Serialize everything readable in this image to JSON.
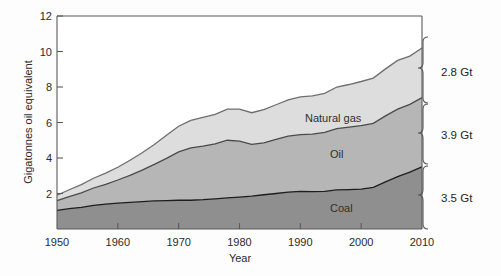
{
  "figure": {
    "background_color": "#fdfdfd",
    "plot_background_color": "#ffffff"
  },
  "axes": {
    "y_title": "Gigatonnes oil equivalent",
    "x_title": "Year",
    "y_ticks": [
      "12",
      "10",
      "8",
      "6",
      "4",
      "2"
    ],
    "x_ticks": [
      "1950",
      "1960",
      "1970",
      "1980",
      "1990",
      "2000",
      "2010"
    ]
  },
  "series_labels": {
    "gas": "Natural gas",
    "oil": "Oil",
    "coal": "Coal"
  },
  "annotations": {
    "gas_total": "2.8 Gt",
    "oil_total": "3.9 Gt",
    "coal_total": "3.5 Gt"
  },
  "colors": {
    "coal": "#8f8f8f",
    "oil": "#b6b6b6",
    "gas": "#dddddd",
    "coal_outline": "#1d1d1d",
    "oil_outline": "#4a4a4a",
    "gas_outline": "#6e6e6e",
    "axis": "#5a5a5a",
    "text": "#2b2b2b"
  },
  "chart_data": {
    "type": "area",
    "title": "",
    "xlabel": "Year",
    "ylabel": "Gigatonnes oil equivalent",
    "xlim": [
      1950,
      2010
    ],
    "ylim": [
      0,
      12
    ],
    "stacked": true,
    "grid": false,
    "legend": "inline-labels",
    "x": [
      1950,
      1952,
      1954,
      1956,
      1958,
      1960,
      1962,
      1964,
      1966,
      1968,
      1970,
      1972,
      1974,
      1976,
      1978,
      1980,
      1982,
      1984,
      1986,
      1988,
      1990,
      1992,
      1994,
      1996,
      1998,
      2000,
      2002,
      2004,
      2006,
      2008,
      2010
    ],
    "series": [
      {
        "name": "Coal",
        "total_2010": 3.5,
        "values": [
          1.05,
          1.15,
          1.22,
          1.33,
          1.4,
          1.46,
          1.5,
          1.54,
          1.58,
          1.6,
          1.62,
          1.62,
          1.65,
          1.7,
          1.75,
          1.8,
          1.85,
          1.93,
          2.0,
          2.08,
          2.12,
          2.1,
          2.12,
          2.2,
          2.22,
          2.25,
          2.35,
          2.65,
          2.95,
          3.2,
          3.5
        ]
      },
      {
        "name": "Oil",
        "total_2010": 3.9,
        "values": [
          0.55,
          0.68,
          0.82,
          0.98,
          1.12,
          1.3,
          1.52,
          1.78,
          2.06,
          2.38,
          2.72,
          2.95,
          3.02,
          3.1,
          3.25,
          3.15,
          2.92,
          2.92,
          3.05,
          3.15,
          3.2,
          3.25,
          3.32,
          3.45,
          3.52,
          3.58,
          3.6,
          3.72,
          3.8,
          3.82,
          3.9
        ]
      },
      {
        "name": "Natural gas",
        "total_2010": 2.8,
        "values": [
          0.3,
          0.38,
          0.46,
          0.55,
          0.63,
          0.72,
          0.85,
          0.98,
          1.12,
          1.3,
          1.45,
          1.55,
          1.62,
          1.66,
          1.75,
          1.8,
          1.78,
          1.88,
          1.95,
          2.05,
          2.12,
          2.15,
          2.2,
          2.35,
          2.4,
          2.48,
          2.55,
          2.65,
          2.75,
          2.72,
          2.8
        ]
      }
    ],
    "stack_tops": {
      "coal": [
        1.05,
        1.15,
        1.22,
        1.33,
        1.4,
        1.46,
        1.5,
        1.54,
        1.58,
        1.6,
        1.62,
        1.62,
        1.65,
        1.7,
        1.75,
        1.8,
        1.85,
        1.93,
        2.0,
        2.08,
        2.12,
        2.1,
        2.12,
        2.2,
        2.22,
        2.25,
        2.35,
        2.65,
        2.95,
        3.2,
        3.5
      ],
      "oil": [
        1.6,
        1.83,
        2.04,
        2.31,
        2.52,
        2.76,
        3.02,
        3.32,
        3.64,
        3.98,
        4.34,
        4.57,
        4.67,
        4.8,
        5.0,
        4.95,
        4.77,
        4.85,
        5.05,
        5.23,
        5.32,
        5.35,
        5.44,
        5.65,
        5.74,
        5.83,
        5.95,
        6.37,
        6.75,
        7.02,
        7.4
      ],
      "gas": [
        1.9,
        2.21,
        2.5,
        2.86,
        3.15,
        3.48,
        3.87,
        4.3,
        4.76,
        5.28,
        5.79,
        6.12,
        6.29,
        6.46,
        6.75,
        6.75,
        6.55,
        6.73,
        7.0,
        7.28,
        7.44,
        7.5,
        7.64,
        8.0,
        8.14,
        8.31,
        8.5,
        9.02,
        9.5,
        9.74,
        10.2
      ]
    }
  }
}
